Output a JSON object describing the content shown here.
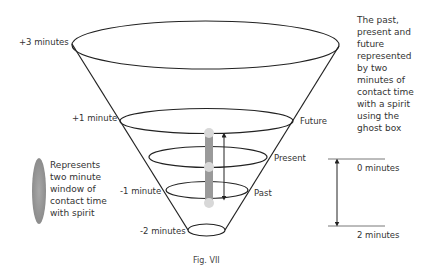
{
  "figure": {
    "caption": "Fig. VII",
    "description_lines": [
      "The past,",
      "present and",
      "future",
      "represented",
      "by two",
      "minutes of",
      "contact time",
      "with a spirit",
      "using the",
      "ghost box"
    ],
    "legend_lines": [
      "Represents",
      "two minute",
      "window of",
      "contact time",
      "with spirit"
    ],
    "legend_color": "#9a9a9a"
  },
  "cone": {
    "levels": [
      {
        "time_label": "+3 minutes"
      },
      {
        "time_label": "+1 minute",
        "tense_label": "Future"
      },
      {
        "tense_label": "Present"
      },
      {
        "time_label": "-1 minute",
        "tense_label": "Past"
      },
      {
        "time_label": "-2 minutes"
      }
    ]
  },
  "scale": {
    "top_label": "0 minutes",
    "bottom_label": "2 minutes"
  }
}
